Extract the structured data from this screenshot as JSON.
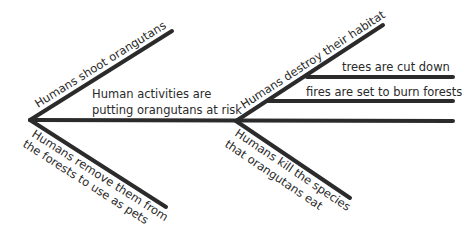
{
  "diagram": {
    "type": "tree-fishbone",
    "root": {
      "label_line1": "Human activities are",
      "label_line2": "putting orangutans at risk"
    },
    "left_branches": {
      "upper": "Humans shoot orangutans",
      "lower_line1": "Humans remove them from",
      "lower_line2": "the forests to use as pets"
    },
    "right_branches": {
      "upper": "Humans destroy their habitat",
      "upper_sub": [
        "trees are cut down",
        "fires are set to burn forests",
        ""
      ],
      "lower_line1": "Humans kill the species",
      "lower_line2": "that orangutans eat"
    },
    "colors": {
      "line": "#2b2b2b",
      "text": "#2a2a2a",
      "background": "#ffffff"
    }
  }
}
